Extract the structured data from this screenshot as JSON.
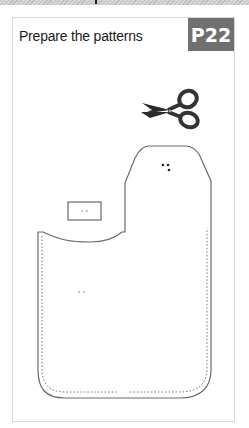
{
  "header": {
    "title": "Prepare the patterns",
    "page_badge": "P22"
  },
  "colors": {
    "badge_bg": "#707070",
    "badge_text": "#ffffff",
    "outline": "#6a6a6a",
    "stitch": "#777777"
  },
  "icons": {
    "scissors": "scissors-icon"
  }
}
